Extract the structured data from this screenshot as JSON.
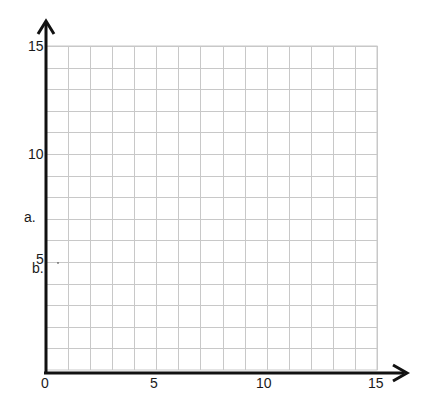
{
  "chart_data": {
    "type": "scatter",
    "title": "",
    "xlabel": "",
    "ylabel": "",
    "xlim": [
      0,
      15
    ],
    "ylim": [
      0,
      15
    ],
    "x_ticks": [
      "0",
      "5",
      "10",
      "15"
    ],
    "y_ticks": [
      "5",
      "10",
      "15"
    ],
    "grid": true,
    "grid_step": 1,
    "series": [],
    "annotations": [
      {
        "text": "a.",
        "position": "left of y-axis near y=7"
      },
      {
        "text": "b.",
        "position": "left of y-axis near y=4.7"
      }
    ]
  },
  "labels": {
    "x0": "0",
    "x5": "5",
    "x10": "10",
    "x15": "15",
    "y5": "5",
    "y10": "10",
    "y15": "15",
    "a": "a.",
    "b": "b."
  },
  "colors": {
    "axis": "#111111",
    "grid": "#c8c8c8",
    "text": "#1a1a1a"
  }
}
